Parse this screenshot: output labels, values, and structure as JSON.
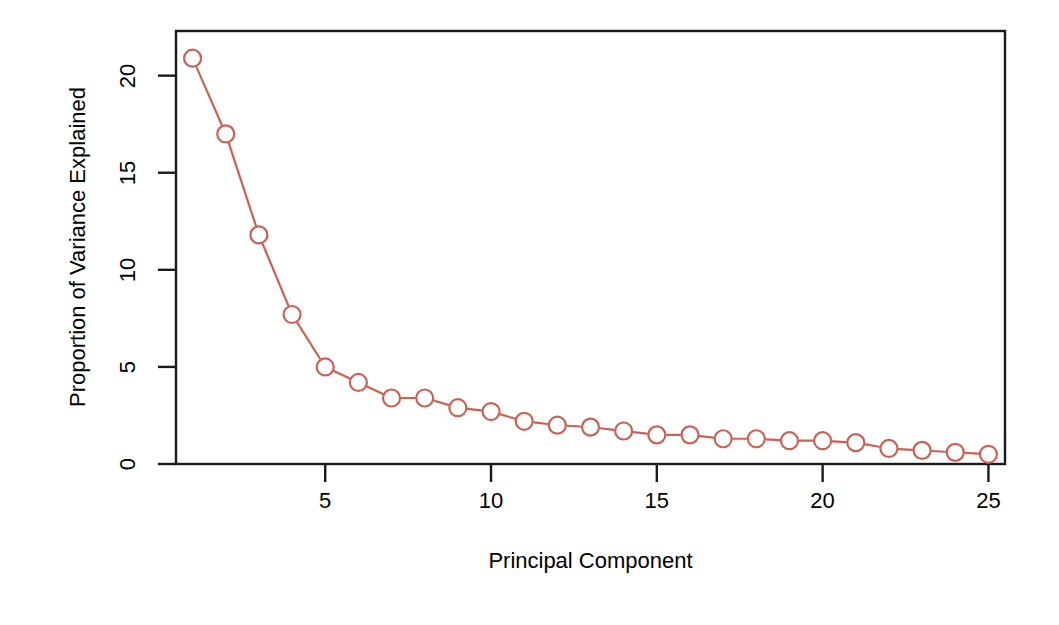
{
  "chart_data": {
    "type": "line",
    "title": "",
    "subtitle": "",
    "xlabel": "Principal Component",
    "ylabel": "Proportion of Variance Explained",
    "x": [
      1,
      2,
      3,
      4,
      5,
      6,
      7,
      8,
      9,
      10,
      11,
      12,
      13,
      14,
      15,
      16,
      17,
      18,
      19,
      20,
      21,
      22,
      23,
      24,
      25
    ],
    "values": [
      20.9,
      17.0,
      11.8,
      7.7,
      5.0,
      4.2,
      3.4,
      3.4,
      2.9,
      2.7,
      2.2,
      2.0,
      1.9,
      1.7,
      1.5,
      1.5,
      1.3,
      1.3,
      1.2,
      1.2,
      1.1,
      0.8,
      0.7,
      0.6,
      0.5
    ],
    "series": [
      {
        "name": "Proportion of Variance Explained",
        "values": [
          20.9,
          17.0,
          11.8,
          7.7,
          5.0,
          4.2,
          3.4,
          3.4,
          2.9,
          2.7,
          2.2,
          2.0,
          1.9,
          1.7,
          1.5,
          1.5,
          1.3,
          1.3,
          1.2,
          1.2,
          1.1,
          0.8,
          0.7,
          0.6,
          0.5
        ],
        "color": "#cd6155",
        "marker": "open-circle",
        "line_style": "solid"
      }
    ],
    "xlim": [
      0.5,
      25.5
    ],
    "ylim": [
      0,
      22.3
    ],
    "xticks": [
      5,
      10,
      15,
      20,
      25
    ],
    "xtick_labels": [
      "5",
      "10",
      "15",
      "20",
      "25"
    ],
    "yticks": [
      0,
      5,
      10,
      15,
      20
    ],
    "ytick_labels": [
      "0",
      "5",
      "10",
      "15",
      "20"
    ],
    "grid": false,
    "legend": null,
    "legend_position": "none",
    "box_frame": true,
    "annotations": []
  },
  "style": {
    "marker_color": "#cd6155",
    "line_color": "#cd6155",
    "axis_color": "#1a1a1a",
    "text_color": "#000000",
    "background": "#ffffff"
  }
}
